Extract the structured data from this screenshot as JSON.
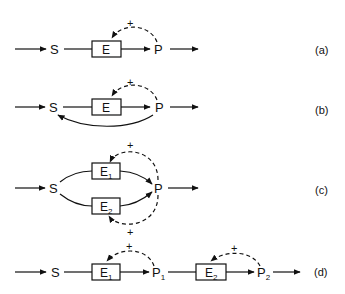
{
  "diagram": {
    "panels": [
      {
        "label": "(a)",
        "substrate": "S",
        "enzyme": "E",
        "product": "P",
        "feedback_sign": "+"
      },
      {
        "label": "(b)",
        "substrate": "S",
        "enzyme": "E",
        "product": "P",
        "feedback_sign": "+"
      },
      {
        "label": "(c)",
        "substrate": "S",
        "enzyme_1": "E",
        "enzyme_1_sub": "1",
        "enzyme_2": "E",
        "enzyme_2_sub": "2",
        "product": "P",
        "feedback_sign_1": "+",
        "feedback_sign_2": "+"
      },
      {
        "label": "(d)",
        "substrate": "S",
        "enzyme_1": "E",
        "enzyme_1_sub": "1",
        "product_1": "P",
        "product_1_sub": "1",
        "enzyme_2": "E",
        "enzyme_2_sub": "2",
        "product_2": "P",
        "product_2_sub": "2",
        "feedback_sign_1": "+",
        "feedback_sign_2": "+"
      }
    ]
  }
}
